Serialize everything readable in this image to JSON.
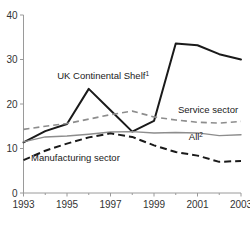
{
  "chart_data": {
    "type": "line",
    "title": "",
    "subtitle": "",
    "xlabel": "",
    "ylabel": "",
    "x": [
      1993,
      1994,
      1995,
      1996,
      1997,
      1998,
      1999,
      2000,
      2001,
      2002,
      2003
    ],
    "xlim": [
      1993,
      2003
    ],
    "ylim": [
      0,
      40
    ],
    "grid": false,
    "legend_position": "inline-annotations",
    "y_ticks": [
      "0",
      "10",
      "20",
      "30",
      "40"
    ],
    "y_tick_values": [
      0,
      10,
      20,
      30,
      40
    ],
    "x_ticks": [
      "1993",
      "1995",
      "1997",
      "1999",
      "2001",
      "2003"
    ],
    "x_tick_values": [
      1993,
      1995,
      1997,
      1999,
      2001,
      2003
    ],
    "x_minor_tick_values": [
      1994,
      1996,
      1998,
      2000,
      2002
    ],
    "series": [
      {
        "name": "UK Continental Shelf",
        "footnote": "1",
        "label": "UK Continental Shelf",
        "style": "solid",
        "color": "#1a1a1a",
        "values": [
          11.4,
          13.9,
          15.5,
          23.4,
          18.6,
          13.8,
          16.2,
          33.6,
          33.2,
          31.2,
          30.0
        ]
      },
      {
        "name": "Service sector",
        "footnote": "",
        "label": "Service sector",
        "style": "dashed",
        "color": "#8d8d8d",
        "values": [
          14.3,
          15.0,
          15.6,
          16.6,
          17.6,
          18.4,
          17.1,
          16.4,
          15.9,
          15.7,
          16.1
        ]
      },
      {
        "name": "All",
        "footnote": "2",
        "label": "All",
        "style": "solid",
        "color": "#8d8d8d",
        "values": [
          11.5,
          12.6,
          12.8,
          13.2,
          13.7,
          13.8,
          13.5,
          13.6,
          13.5,
          12.9,
          13.1
        ]
      },
      {
        "name": "Manufacturing sector",
        "footnote": "",
        "label": "Manufacturing sector",
        "style": "dashed",
        "color": "#1a1a1a",
        "values": [
          7.4,
          9.5,
          11.1,
          12.5,
          13.4,
          12.6,
          10.7,
          9.2,
          8.4,
          7.0,
          7.2
        ]
      }
    ],
    "annotations": [
      {
        "text": "UK Continental Shelf",
        "sup": "1",
        "x": 1994.55,
        "y": 25.6
      },
      {
        "text": "Service sector",
        "sup": "",
        "x": 2000.1,
        "y": 18.0
      },
      {
        "text": "All",
        "sup": "2",
        "x": 2000.6,
        "y": 11.9
      },
      {
        "text": "Manufacturing sector",
        "sup": "",
        "x": 1993.35,
        "y": 7.2
      }
    ]
  }
}
